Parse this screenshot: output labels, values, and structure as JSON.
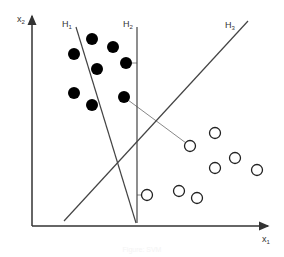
{
  "diagram": {
    "axes": {
      "x_label": "x",
      "x_sub": "1",
      "y_label": "x",
      "y_sub": "2",
      "color": "#333333"
    },
    "hyperplanes": [
      {
        "label": "H",
        "sub": "1",
        "x1": 76,
        "y1": 27,
        "x2": 136,
        "y2": 223
      },
      {
        "label": "H",
        "sub": "2",
        "x1": 137,
        "y1": 27,
        "x2": 137,
        "y2": 223
      },
      {
        "label": "H",
        "sub": "3",
        "x1": 64,
        "y1": 221,
        "x2": 248,
        "y2": 21
      }
    ],
    "class_filled": [
      {
        "x": 92,
        "y": 39
      },
      {
        "x": 113,
        "y": 47
      },
      {
        "x": 74,
        "y": 54
      },
      {
        "x": 126,
        "y": 63
      },
      {
        "x": 97,
        "y": 69
      },
      {
        "x": 74,
        "y": 93
      },
      {
        "x": 124,
        "y": 97
      },
      {
        "x": 92,
        "y": 105
      }
    ],
    "class_open": [
      {
        "x": 215,
        "y": 133
      },
      {
        "x": 190,
        "y": 146
      },
      {
        "x": 235,
        "y": 158
      },
      {
        "x": 215,
        "y": 168
      },
      {
        "x": 257,
        "y": 170
      },
      {
        "x": 147,
        "y": 195
      },
      {
        "x": 179,
        "y": 191
      },
      {
        "x": 197,
        "y": 198
      }
    ],
    "margin_lines": [
      {
        "x1": 130,
        "y1": 63,
        "x2": 137,
        "y2": 63
      },
      {
        "x1": 137,
        "y1": 195,
        "x2": 141,
        "y2": 195
      },
      {
        "x1": 128,
        "y1": 100,
        "x2": 186,
        "y2": 143
      }
    ],
    "caption": "Figure: SVM"
  }
}
